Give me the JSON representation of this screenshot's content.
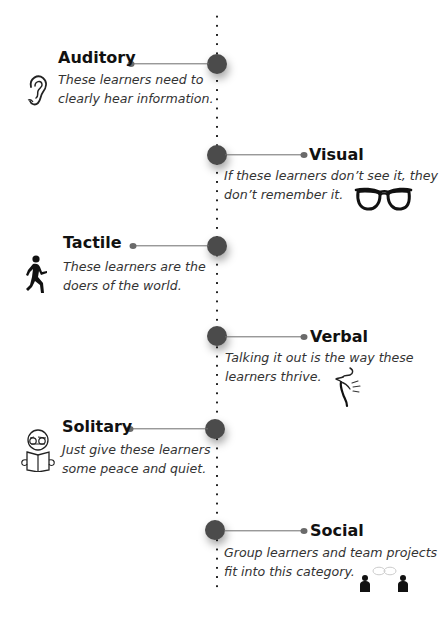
{
  "timeline": {
    "line_color": "#222222",
    "node_color": "#4b4b4b",
    "connector_color": "#6e6e6e"
  },
  "items": [
    {
      "title": "Auditory",
      "side": "left",
      "description_lines": [
        "These learners need to",
        "clearly hear information."
      ],
      "icon": "ear-icon"
    },
    {
      "title": "Visual",
      "side": "right",
      "description_lines": [
        "If these learners don’t see it, they",
        "don’t remember it."
      ],
      "icon": "glasses-icon"
    },
    {
      "title": "Tactile",
      "side": "left",
      "description_lines": [
        "These learners are the",
        "doers of the world."
      ],
      "icon": "running-person-icon"
    },
    {
      "title": "Verbal",
      "side": "right",
      "description_lines": [
        "Talking it out is the way these",
        "learners thrive."
      ],
      "icon": "speaking-face-icon"
    },
    {
      "title": "Solitary",
      "side": "left",
      "description_lines": [
        "Just give these learners",
        "some peace and quiet."
      ],
      "icon": "reading-person-icon"
    },
    {
      "title": "Social",
      "side": "right",
      "description_lines": [
        "Group learners and team projects",
        "fit into this category."
      ],
      "icon": "two-people-chatting-icon"
    }
  ]
}
